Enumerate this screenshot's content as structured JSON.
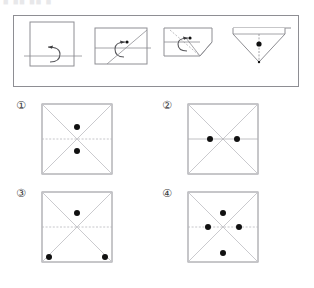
{
  "header": {
    "cropped_text": "■ ■■ ■■  ■"
  },
  "stimulus": {
    "name": "paper-folding-sequence",
    "steps": [
      {
        "id": "step-1",
        "label": "square-fold-bottom-up",
        "shape": "square",
        "crease": "horizontal-lower",
        "arrow": "curved-fold-up",
        "hole": false
      },
      {
        "id": "step-2",
        "label": "rectangle-fold-diagonal",
        "shape": "rectangle",
        "crease": "horizontal-mid-and-diagonal",
        "arrow": "curved-fold-left",
        "hole": false
      },
      {
        "id": "step-3",
        "label": "corner-folded-flap",
        "shape": "notched-pentagon",
        "crease": "diagonal-flap",
        "arrow": "curved-fold-left",
        "hole": false
      },
      {
        "id": "step-4",
        "label": "triangle-punched",
        "shape": "down-triangle",
        "crease": "vertical-center",
        "arrow": "none",
        "hole": true
      }
    ]
  },
  "options": [
    {
      "id": "option-1",
      "numeral": "①",
      "diagonals": true,
      "midline": "dotted-horizontal",
      "dots": [
        {
          "x": 50,
          "y": 33
        },
        {
          "x": 50,
          "y": 67
        }
      ]
    },
    {
      "id": "option-2",
      "numeral": "②",
      "diagonals": true,
      "midline": "solid-horizontal",
      "dots": [
        {
          "x": 31,
          "y": 50
        },
        {
          "x": 69,
          "y": 50
        }
      ]
    },
    {
      "id": "option-3",
      "numeral": "③",
      "diagonals": true,
      "midline": "dotted-horizontal",
      "dots": [
        {
          "x": 50,
          "y": 30
        },
        {
          "x": 10,
          "y": 92
        },
        {
          "x": 90,
          "y": 92
        }
      ]
    },
    {
      "id": "option-4",
      "numeral": "④",
      "diagonals": true,
      "midline": "dotted-horizontal",
      "dots": [
        {
          "x": 50,
          "y": 30
        },
        {
          "x": 28,
          "y": 50
        },
        {
          "x": 72,
          "y": 50
        },
        {
          "x": 50,
          "y": 88
        }
      ]
    }
  ],
  "style": {
    "line_color": "#8e8e93",
    "dot_color": "#111111",
    "border_color": "#8e8e93",
    "background": "#ffffff"
  }
}
